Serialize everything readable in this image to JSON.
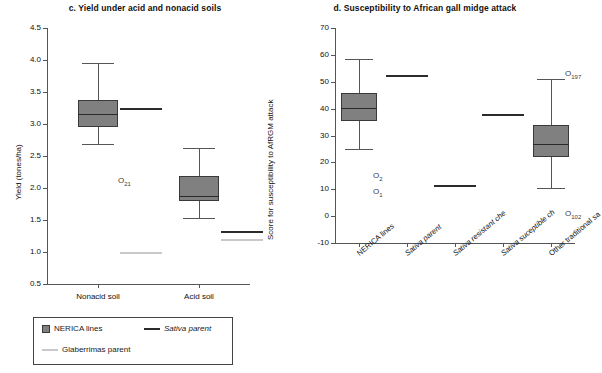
{
  "figure": {
    "panels": [
      "c",
      "d"
    ]
  },
  "chart_data": [
    {
      "type": "box",
      "panel_letter": "c.",
      "title": "c. Yield under acid and nonacid soils",
      "xlabel": "",
      "ylabel": "Yield (tones/ha)",
      "ylim": [
        0.5,
        4.5
      ],
      "ytick_step": 0.5,
      "yticks": [
        "4.5",
        "4.0",
        "3.5",
        "3.0",
        "2.5",
        "2.0",
        "1.5",
        "1.0",
        "0.5"
      ],
      "categories": [
        "Nonacid soil",
        "Acid soil"
      ],
      "grid": false,
      "boxes": [
        {
          "category": "Nonacid soil",
          "whisker_low": 2.68,
          "q1": 2.95,
          "median": 3.16,
          "q3": 3.38,
          "whisker_high": 3.95
        },
        {
          "category": "Acid soil",
          "whisker_low": 1.53,
          "q1": 1.8,
          "median": 1.88,
          "q3": 2.18,
          "whisker_high": 2.63
        }
      ],
      "reference_lines": [
        {
          "series": "Sativa parent",
          "category": "Nonacid soil",
          "value": 3.25,
          "color": "#2b2b2b"
        },
        {
          "series": "Glaberrimas parent",
          "category": "Nonacid soil",
          "value": 1.0,
          "color": "#c9c9c9"
        },
        {
          "series": "Sativa parent",
          "category": "Acid soil",
          "value": 1.33,
          "color": "#2b2b2b"
        },
        {
          "series": "Glaberrimas parent",
          "category": "Acid soil",
          "value": 1.21,
          "color": "#c9c9c9"
        }
      ],
      "outliers": [
        {
          "label": "O",
          "sub": "21",
          "category": "Nonacid soil",
          "value": 2.1
        }
      ]
    },
    {
      "type": "box",
      "panel_letter": "d.",
      "title": "d. Susceptibility to African gall midge attack",
      "xlabel": "",
      "ylabel": "Score for susceptibility to AfRGM attack",
      "ylim": [
        -10,
        70
      ],
      "ytick_step": 10,
      "yticks": [
        "70",
        "60",
        "50",
        "40",
        "30",
        "20",
        "10",
        "0",
        "-10"
      ],
      "categories": [
        "NERICA lines",
        "Sativa parent",
        "Sativa resistant che",
        "Sativa suceptible ch",
        "Other traditional sa"
      ],
      "categories_italic": [
        false,
        true,
        true,
        true,
        false
      ],
      "grid": false,
      "boxes": [
        {
          "category": "NERICA lines",
          "whisker_low": 25.0,
          "q1": 35.5,
          "median": 40.3,
          "q3": 45.7,
          "whisker_high": 58.3
        },
        {
          "category": "Other traditional sa",
          "whisker_low": 10.3,
          "q1": 22.0,
          "median": 27.0,
          "q3": 34.0,
          "whisker_high": 51.0
        }
      ],
      "reference_lines": [
        {
          "series": "Sativa parent",
          "category": "Sativa parent",
          "value": 52.4,
          "color": "#2b2b2b"
        },
        {
          "series": "Sativa resistant check",
          "category": "Sativa resistant che",
          "value": 11.5,
          "color": "#2b2b2b"
        },
        {
          "series": "Sativa suceptible check",
          "category": "Sativa suceptible ch",
          "value": 37.9,
          "color": "#2b2b2b"
        }
      ],
      "outliers": [
        {
          "label": "O",
          "sub": "2",
          "category": "NERICA lines",
          "value": 14.5
        },
        {
          "label": "O",
          "sub": "1",
          "category": "NERICA lines",
          "value": 8.5
        },
        {
          "label": "O",
          "sub": "197",
          "category": "Other traditional sa",
          "value": 52.5
        },
        {
          "label": "O",
          "sub": "102",
          "category": "Other traditional sa",
          "value": 0.5
        }
      ]
    }
  ],
  "legend": {
    "items": [
      {
        "label": "NERICA lines",
        "marker": "box",
        "italic": false
      },
      {
        "label": "Sativa parent",
        "marker": "dark-line",
        "italic": true
      },
      {
        "label": "Glaberrimas parent",
        "marker": "light-line",
        "italic": false
      }
    ]
  }
}
